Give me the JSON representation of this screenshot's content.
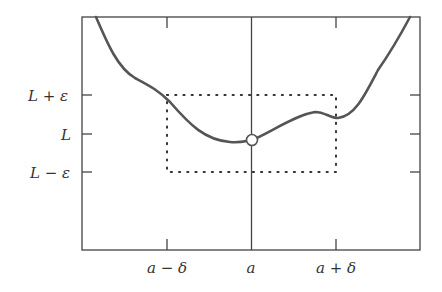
{
  "figure": {
    "y_labels": {
      "upper": "L + ε",
      "middle": "L",
      "lower": "L − ε"
    },
    "x_labels": {
      "left": "a − δ",
      "middle": "a",
      "right": "a + δ"
    },
    "colors": {
      "curve": "#555555",
      "frame": "#444444",
      "dots": "#333333",
      "hole_fill": "#ffffff"
    }
  }
}
